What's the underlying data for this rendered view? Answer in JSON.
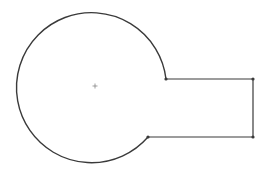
{
  "diagram": {
    "type": "sketch-profile",
    "stroke_color": "#3a3a3a",
    "background": "#ffffff",
    "circle": {
      "cx": 95,
      "cy": 86,
      "r": 75
    },
    "center_mark": {
      "x": 95,
      "y": 86
    },
    "tab": {
      "top_left": [
        166,
        79
      ],
      "top_right": [
        253,
        79
      ],
      "bottom_right": [
        253,
        137
      ],
      "bottom_left": [
        148,
        137
      ]
    },
    "vertices": [
      [
        166,
        79
      ],
      [
        253,
        79
      ],
      [
        253,
        137
      ],
      [
        148,
        137
      ]
    ]
  }
}
